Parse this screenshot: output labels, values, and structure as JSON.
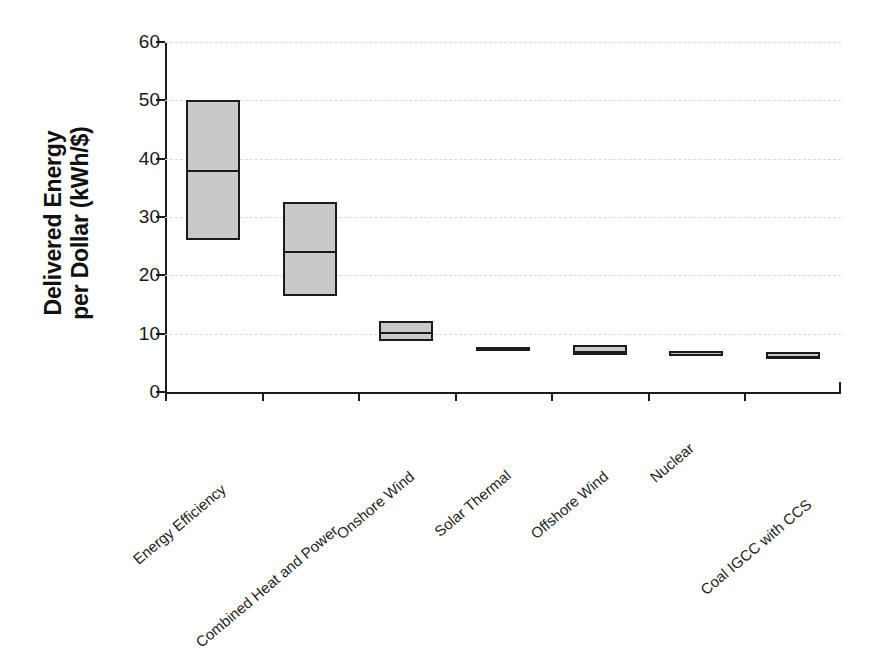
{
  "chart_data": {
    "type": "bar",
    "title": "",
    "subtitle": "",
    "xlabel": "",
    "ylabel": "Delivered Energy per Dollar (kWh/$)",
    "ylabel_lines": [
      "Delivered Energy",
      "per Dollar (kWh/$)"
    ],
    "units": "kWh/$",
    "ylim": [
      0,
      60
    ],
    "ytick_values": [
      0,
      10,
      20,
      30,
      40,
      50,
      60
    ],
    "ytick_labels": [
      "0",
      "10",
      "20",
      "30",
      "40",
      "50",
      "60"
    ],
    "grid": true,
    "grid_axis": "y",
    "grid_style": "dashed",
    "legend": "none",
    "categories": [
      "Energy Efficiency",
      "Combined Heat and Power",
      "Onshore Wind",
      "Solar Thermal",
      "Offshore Wind",
      "Nuclear",
      "Coal IGCC with CCS"
    ],
    "series": [
      {
        "name": "Delivered energy per dollar range",
        "low": [
          26.0,
          16.5,
          8.8,
          7.3,
          6.3,
          6.1,
          5.7
        ],
        "median": [
          38.0,
          24.2,
          10.3,
          7.5,
          7.0,
          6.5,
          6.2
        ],
        "high": [
          50.0,
          32.5,
          12.2,
          7.8,
          8.0,
          7.0,
          6.8
        ]
      }
    ],
    "box_fill_color": "#c9c9c9",
    "box_edge_color": "#1b1b1b",
    "grid_color": "#d9d9d9",
    "background_color": "#ffffff"
  }
}
